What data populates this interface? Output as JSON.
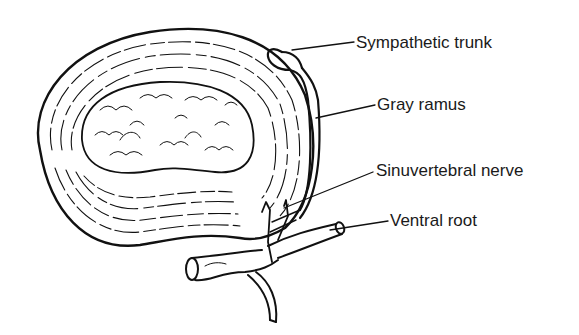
{
  "diagram": {
    "line_color": "#111111",
    "background": "#ffffff",
    "labels": [
      {
        "id": "sympathetic_trunk",
        "text": "Sympathetic trunk",
        "x": 356,
        "y": 36
      },
      {
        "id": "gray_ramus",
        "text": "Gray ramus",
        "x": 377,
        "y": 98
      },
      {
        "id": "sinuvertebral_nerve",
        "text": "Sinuvertebral nerve",
        "x": 376,
        "y": 164
      },
      {
        "id": "ventral_root",
        "text": "Ventral root",
        "x": 390,
        "y": 214
      }
    ]
  }
}
